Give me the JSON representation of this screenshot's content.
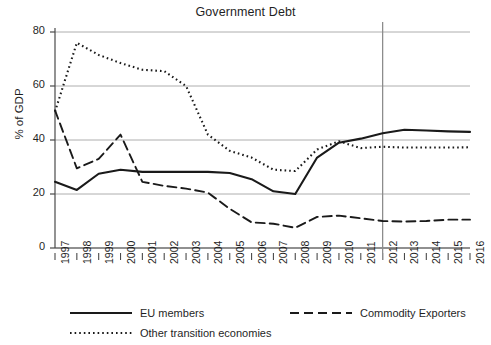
{
  "chart_data": {
    "type": "line",
    "title": "Government Debt",
    "xlabel": "",
    "ylabel": "% of GDP",
    "x": [
      1997,
      1998,
      1999,
      2000,
      2001,
      2002,
      2003,
      2004,
      2005,
      2006,
      2007,
      2008,
      2009,
      2010,
      2011,
      2012,
      2013,
      2014,
      2015,
      2016
    ],
    "xlim": [
      1997,
      2016
    ],
    "ylim": [
      0,
      80
    ],
    "yticks": [
      0,
      20,
      40,
      60,
      80
    ],
    "xticks": [
      "1997",
      "1998",
      "1999",
      "2000",
      "2001",
      "2002",
      "2003",
      "2004",
      "2005",
      "2006",
      "2007",
      "2008",
      "2009",
      "2010",
      "2011",
      "2012",
      "2013",
      "2014",
      "2015",
      "2016"
    ],
    "grid": true,
    "grid_axis": "y",
    "legend_position": "bottom",
    "annotations": [
      {
        "type": "vertical-line",
        "x": 2012,
        "label": "forecast-divider"
      }
    ],
    "series": [
      {
        "name": "EU members",
        "style": "solid",
        "color": "#1a1a1a",
        "values": [
          24.5,
          21.5,
          27.5,
          29.0,
          28.2,
          28.2,
          28.2,
          28.2,
          27.8,
          25.5,
          21.0,
          20.0,
          33.5,
          39.0,
          40.5,
          42.5,
          43.8,
          43.5,
          43.2,
          43.0
        ]
      },
      {
        "name": "Commodity Exporters",
        "style": "dashed",
        "color": "#1a1a1a",
        "values": [
          51.0,
          29.5,
          33.0,
          42.0,
          24.5,
          23.0,
          22.0,
          20.5,
          14.5,
          9.5,
          9.0,
          7.5,
          11.5,
          12.0,
          11.0,
          10.0,
          9.8,
          10.0,
          10.5,
          10.5
        ]
      },
      {
        "name": "Other transition economies",
        "style": "dotted",
        "color": "#1a1a1a",
        "values": [
          50.5,
          76.0,
          71.5,
          68.5,
          66.0,
          65.5,
          60.0,
          42.0,
          36.0,
          33.5,
          29.0,
          28.5,
          36.5,
          39.5,
          37.0,
          37.5,
          37.2,
          37.2,
          37.2,
          37.3
        ]
      }
    ]
  },
  "legend": {
    "items": [
      {
        "label": "EU members",
        "style": "solid"
      },
      {
        "label": "Commodity Exporters",
        "style": "dashed"
      },
      {
        "label": "Other transition economies",
        "style": "dotted"
      }
    ]
  },
  "colors": {
    "ink": "#1a1a1a",
    "gridline": "#aeaeae",
    "axis": "#4a4a4a",
    "marker_line": "#8c8c8c",
    "background": "#ffffff"
  }
}
